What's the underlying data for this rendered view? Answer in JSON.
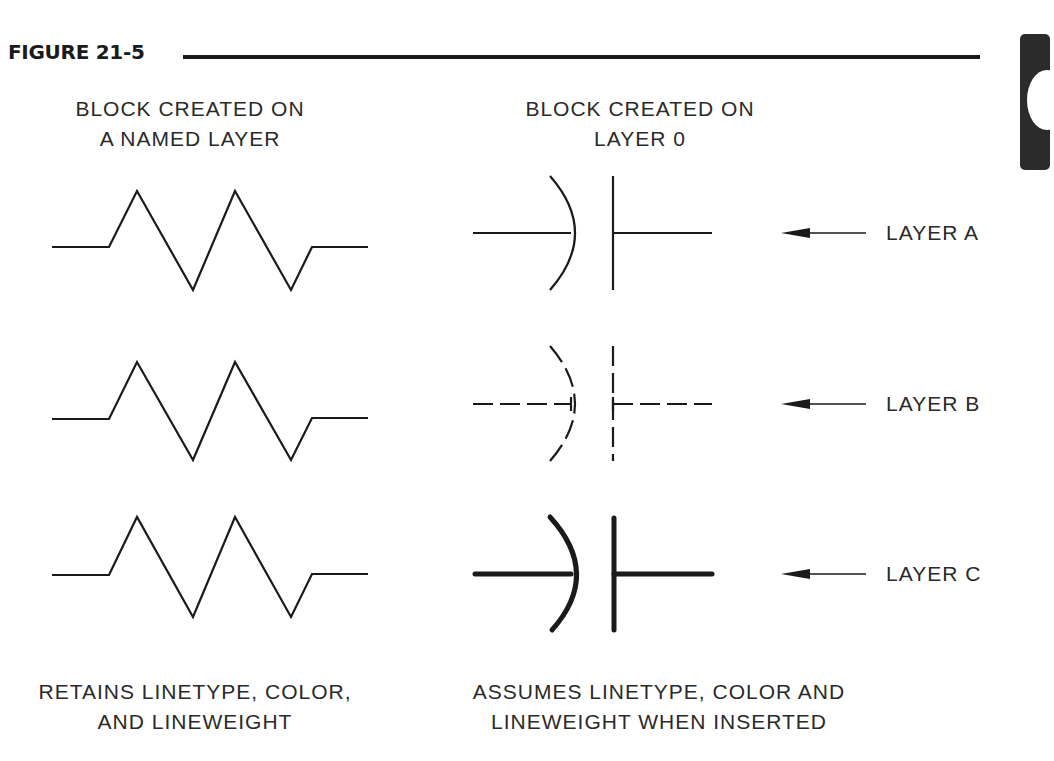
{
  "figure": {
    "title": "FIGURE 21-5"
  },
  "columns": {
    "left_header": "BLOCK CREATED ON\nA NAMED LAYER",
    "right_header": "BLOCK CREATED ON\nLAYER 0",
    "left_footer": "RETAINS LINETYPE, COLOR,\nAND LINEWEIGHT",
    "right_footer": "ASSUMES LINETYPE, COLOR AND\nLINEWEIGHT WHEN INSERTED"
  },
  "rows": [
    {
      "layer_label": "LAYER A",
      "linetype": "continuous",
      "lineweight": "thin"
    },
    {
      "layer_label": "LAYER B",
      "linetype": "dashed",
      "lineweight": "thin"
    },
    {
      "layer_label": "LAYER C",
      "linetype": "continuous",
      "lineweight": "heavy"
    }
  ],
  "symbols": {
    "left": "resistor-symbol",
    "right": "capacitor-symbol",
    "pointer": "arrow-left-icon"
  },
  "colors": {
    "ink": "#1a1a1a",
    "background": "#ffffff",
    "tab": "#2b2b2b"
  }
}
